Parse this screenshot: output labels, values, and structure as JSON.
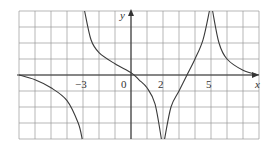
{
  "chart_data": {
    "type": "line",
    "title": "",
    "xlabel": "x",
    "ylabel": "y",
    "xlim": [
      -7,
      8
    ],
    "ylim": [
      -4,
      4
    ],
    "grid": true,
    "tick_labels": [
      {
        "text": "−3",
        "x": -3
      },
      {
        "text": "0",
        "x": 0
      },
      {
        "text": "2",
        "x": 2
      },
      {
        "text": "5",
        "x": 5
      }
    ],
    "vertical_asymptotes": [
      -3,
      2,
      5
    ],
    "horizontal_asymptote": 0,
    "branches": [
      {
        "name": "left",
        "domain": [
          -7,
          -3
        ],
        "points": [
          [
            -7,
            0
          ],
          [
            -6,
            -0.3
          ],
          [
            -5,
            -0.8
          ],
          [
            -4,
            -1.6
          ],
          [
            -3.3,
            -3
          ],
          [
            -3.05,
            -4
          ]
        ]
      },
      {
        "name": "middle",
        "domain": [
          -3,
          2
        ],
        "points": [
          [
            -2.9,
            4
          ],
          [
            -2.5,
            2.2
          ],
          [
            -2,
            1.4
          ],
          [
            -1,
            0.7
          ],
          [
            0,
            0.15
          ],
          [
            0.5,
            -0.3
          ],
          [
            1,
            -0.8
          ],
          [
            1.5,
            -1.8
          ],
          [
            1.9,
            -4
          ]
        ]
      },
      {
        "name": "center-right",
        "domain": [
          2,
          5
        ],
        "points": [
          [
            2.1,
            -4
          ],
          [
            2.5,
            -2
          ],
          [
            3,
            -1
          ],
          [
            3.5,
            0
          ],
          [
            4,
            1
          ],
          [
            4.5,
            2.2
          ],
          [
            4.9,
            4
          ]
        ]
      },
      {
        "name": "right",
        "domain": [
          5,
          8
        ],
        "points": [
          [
            5.1,
            4
          ],
          [
            5.5,
            2
          ],
          [
            6,
            1
          ],
          [
            7,
            0.3
          ],
          [
            8,
            0
          ]
        ]
      }
    ]
  },
  "labels": {
    "x_axis": "x",
    "y_axis": "y",
    "tick_neg3": "−3",
    "tick_0": "0",
    "tick_2": "2",
    "tick_5": "5"
  }
}
